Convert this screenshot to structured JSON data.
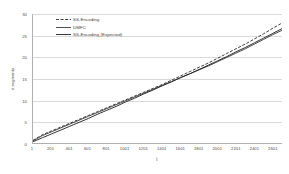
{
  "chart_data": {
    "type": "line",
    "title": "",
    "xlabel": "t",
    "ylabel": "# segments",
    "xlim": [
      1,
      2700
    ],
    "ylim": [
      0,
      30
    ],
    "grid": true,
    "legend_position": "top-left",
    "x_ticks": [
      1,
      201,
      401,
      601,
      801,
      1001,
      1201,
      1401,
      1601,
      1801,
      2001,
      2201,
      2401,
      2601
    ],
    "y_ticks": [
      0,
      5,
      10,
      15,
      20,
      25,
      30
    ],
    "x": [
      1,
      101,
      201,
      301,
      401,
      501,
      601,
      701,
      801,
      901,
      1001,
      1101,
      1201,
      1301,
      1401,
      1501,
      1601,
      1701,
      1801,
      1901,
      2001,
      2101,
      2201,
      2301,
      2401,
      2501,
      2601,
      2700
    ],
    "series": [
      {
        "name": "SS-Encoding",
        "style": "dashed",
        "color": "#2b2b2b",
        "values": [
          0.6,
          1.9,
          2.8,
          3.7,
          4.6,
          5.5,
          6.4,
          7.3,
          8.2,
          9.1,
          10.0,
          10.9,
          11.8,
          12.7,
          13.6,
          14.6,
          15.6,
          16.6,
          17.6,
          18.6,
          19.7,
          20.8,
          21.9,
          23.0,
          24.2,
          25.4,
          26.7,
          27.9
        ]
      },
      {
        "name": "DMFC",
        "style": "solid",
        "color": "#3a3a3a",
        "values": [
          0.5,
          1.7,
          2.6,
          3.5,
          4.4,
          5.3,
          6.2,
          7.1,
          8.0,
          8.9,
          9.8,
          10.7,
          11.6,
          12.5,
          13.4,
          14.3,
          15.2,
          16.1,
          17.0,
          17.9,
          18.9,
          19.9,
          20.9,
          21.9,
          23.0,
          24.1,
          25.2,
          26.2
        ]
      },
      {
        "name": "SS-Encoding (Expected)",
        "style": "solid",
        "color": "#1f1f1f",
        "values": [
          0.3,
          1.2,
          2.1,
          3.0,
          3.9,
          4.8,
          5.7,
          6.7,
          7.6,
          8.5,
          9.5,
          10.4,
          11.4,
          12.3,
          13.3,
          14.2,
          15.2,
          16.1,
          17.1,
          18.1,
          19.1,
          20.1,
          21.2,
          22.2,
          23.3,
          24.4,
          25.5,
          26.6
        ]
      }
    ]
  }
}
